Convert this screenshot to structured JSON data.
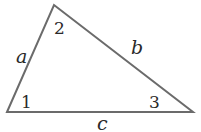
{
  "diagram": {
    "type": "triangle",
    "stroke_color": "#6b6b6b",
    "vertices": [
      {
        "id": "v1",
        "x": 7,
        "y": 112
      },
      {
        "id": "v2",
        "x": 54,
        "y": 5
      },
      {
        "id": "v3",
        "x": 193,
        "y": 112
      }
    ],
    "sides": [
      {
        "id": "a",
        "label": "a",
        "x": 16,
        "y": 63
      },
      {
        "id": "b",
        "label": "b",
        "x": 131,
        "y": 54
      },
      {
        "id": "c",
        "label": "c",
        "x": 97,
        "y": 130
      }
    ],
    "angles": [
      {
        "id": "1",
        "label": "1",
        "x": 21,
        "y": 108
      },
      {
        "id": "2",
        "label": "2",
        "x": 54,
        "y": 34
      },
      {
        "id": "3",
        "label": "3",
        "x": 149,
        "y": 108
      }
    ]
  }
}
